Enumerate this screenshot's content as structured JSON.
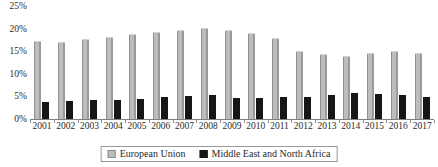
{
  "chart_data": {
    "type": "bar",
    "title": "",
    "subtitle": "",
    "xlabel": "",
    "ylabel": "",
    "ylim": [
      0,
      25
    ],
    "ytick_labels": [
      "0%",
      "5%",
      "10%",
      "15%",
      "20%",
      "25%"
    ],
    "ytick_values": [
      0,
      5,
      10,
      15,
      20,
      25
    ],
    "grid": false,
    "legend_position": "bottom",
    "categories": [
      "2001",
      "2002",
      "2003",
      "2004",
      "2005",
      "2006",
      "2007",
      "2008",
      "2009",
      "2010",
      "2011",
      "2012",
      "2013",
      "2014",
      "2015",
      "2016",
      "2017"
    ],
    "series": [
      {
        "name": "European Union",
        "color": "#bdbdbd",
        "values": [
          17.2,
          17.0,
          17.7,
          18.1,
          18.8,
          19.3,
          19.7,
          20.2,
          19.7,
          19.0,
          17.9,
          15.1,
          14.4,
          14.0,
          14.7,
          15.1,
          14.7
        ]
      },
      {
        "name": "Middle East and North Africa",
        "color": "#161616",
        "values": [
          3.7,
          4.0,
          4.2,
          4.2,
          4.4,
          4.8,
          5.0,
          5.3,
          4.6,
          4.6,
          4.8,
          4.8,
          5.3,
          5.7,
          5.5,
          5.3,
          4.8
        ]
      }
    ]
  },
  "legend": {
    "items": [
      {
        "label": "European Union",
        "swatch": "eu"
      },
      {
        "label": "Middle East and North Africa",
        "swatch": "mena"
      }
    ]
  }
}
